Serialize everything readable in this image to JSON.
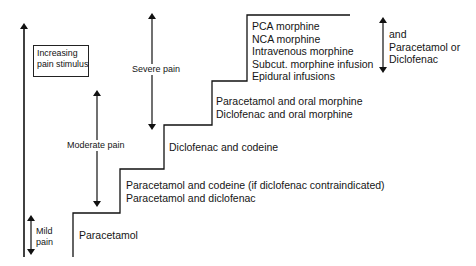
{
  "title_box": {
    "lines": [
      "Increasing",
      "pain stimulus"
    ]
  },
  "severity_labels": {
    "mild": [
      "Mild",
      "pain"
    ],
    "moderate": "Moderate pain",
    "severe": "Severe pain"
  },
  "steps": [
    {
      "level": 1,
      "drugs": [
        "Paracetamol"
      ]
    },
    {
      "level": 2,
      "drugs": [
        "Paracetamol and codeine (if diclofenac contraindicated)",
        "Paracetamol and diclofenac"
      ]
    },
    {
      "level": 3,
      "drugs": [
        "Diclofenac and codeine"
      ]
    },
    {
      "level": 4,
      "drugs": [
        "Paracetamol and oral morphine",
        "Diclofenac and oral morphine"
      ]
    },
    {
      "level": 5,
      "drugs": [
        "PCA morphine",
        "NCA morphine",
        "Intravenous morphine",
        "Subcut. morphine infusion",
        "Epidural infusions"
      ]
    }
  ],
  "adjunct_note": [
    "and",
    "Paracetamol or",
    "Diclofenac"
  ]
}
